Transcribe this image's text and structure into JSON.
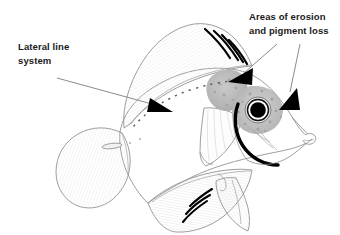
{
  "figure": {
    "type": "anatomical-diagram",
    "background_color": "#ffffff",
    "line_color": "#8a8a8a",
    "accent_color": "#000000",
    "lesion_color": "#b5b5b5"
  },
  "annotations": {
    "lateral_line": {
      "name": "lateral-line-callout",
      "line1": "Lateral line",
      "line2": "system",
      "leader": "arrow pointing right-down to dotted lateral line"
    },
    "erosion": {
      "name": "erosion-callout",
      "line1": "Areas of erosion",
      "line2": "and pigment loss",
      "leader": "two arrows pointing to head lesions"
    }
  },
  "anatomy": {
    "dorsal_fin_stripes": 4,
    "anal_fin_stripes": 3,
    "eye": "black pupil with pale ring",
    "lesions": [
      "gray patch above and forward of eye",
      "gray speckled patch surrounding eye"
    ],
    "lateral_line_style": "dotted arc from head to caudal peduncle",
    "operculum_arc": "thick black curved line below eye"
  }
}
